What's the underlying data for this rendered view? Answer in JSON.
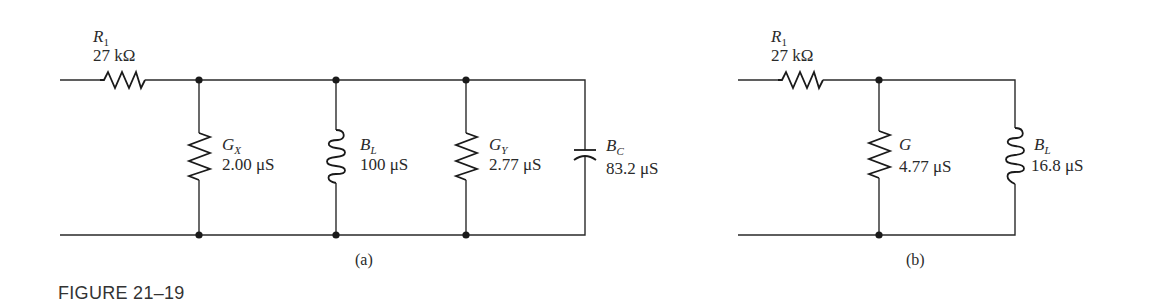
{
  "figure": {
    "title": "FIGURE 21–19"
  },
  "circuit_a": {
    "caption": "(a)",
    "components": [
      {
        "id": "R1",
        "type": "resistor",
        "symbol": "R",
        "subscript": "1",
        "value": "27 kΩ",
        "placement": "series"
      },
      {
        "id": "GX",
        "type": "resistor",
        "symbol": "G",
        "subscript": "X",
        "value": "2.00 μS",
        "placement": "shunt"
      },
      {
        "id": "BL",
        "type": "inductor",
        "symbol": "B",
        "subscript": "L",
        "value": "100 μS",
        "placement": "shunt"
      },
      {
        "id": "GY",
        "type": "resistor",
        "symbol": "G",
        "subscript": "Y",
        "value": "2.77 μS",
        "placement": "shunt"
      },
      {
        "id": "BC",
        "type": "capacitor",
        "symbol": "B",
        "subscript": "C",
        "value": "83.2 μS",
        "placement": "shunt"
      }
    ]
  },
  "circuit_b": {
    "caption": "(b)",
    "components": [
      {
        "id": "R1",
        "type": "resistor",
        "symbol": "R",
        "subscript": "1",
        "value": "27 kΩ",
        "placement": "series"
      },
      {
        "id": "G",
        "type": "resistor",
        "symbol": "G",
        "subscript": "",
        "value": "4.77 μS",
        "placement": "shunt"
      },
      {
        "id": "BL",
        "type": "inductor",
        "symbol": "B",
        "subscript": "L",
        "value": "16.8 μS",
        "placement": "shunt"
      }
    ]
  }
}
